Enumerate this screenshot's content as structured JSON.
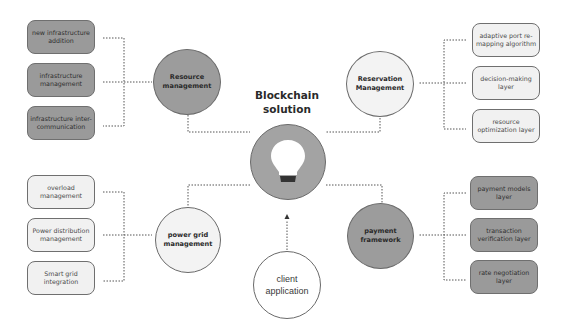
{
  "title": "Blockchain solution",
  "center": {
    "icon": "lightbulb-icon"
  },
  "nodes": {
    "resource": {
      "label": "Resource management",
      "fill": "#9c9c9c"
    },
    "reservation": {
      "label": "Reservation Management",
      "fill": "#f3f3f3"
    },
    "power_grid": {
      "label": "power grid management",
      "fill": "#f3f3f3"
    },
    "payment": {
      "label": "payment framework",
      "fill": "#9c9c9c"
    },
    "client": {
      "label": "client application",
      "fill": "#ffffff"
    }
  },
  "groups": {
    "resource_items": [
      {
        "label": "new infrastructure addition"
      },
      {
        "label": "infrastructure management"
      },
      {
        "label": "infrastructure inter-communication"
      }
    ],
    "reservation_items": [
      {
        "label": "adaptive port re-mapping algorithm"
      },
      {
        "label": "decision-making layer"
      },
      {
        "label": "resource optimization layer"
      }
    ],
    "power_grid_items": [
      {
        "label": "overload management"
      },
      {
        "label": "Power distribution management"
      },
      {
        "label": "Smart grid integration"
      }
    ],
    "payment_items": [
      {
        "label": "payment models layer"
      },
      {
        "label": "transaction verification layer"
      },
      {
        "label": "rate negotiation layer"
      }
    ]
  },
  "colors": {
    "dark": "#9a9a9a",
    "light": "#f1f1f1",
    "line": "#555555"
  }
}
